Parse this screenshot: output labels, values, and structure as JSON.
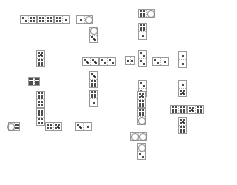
{
  "game": {
    "title": "Dominoes",
    "pip_color": "#111111",
    "border_color": "#9a9a9a",
    "tiles": [
      {
        "x": 20,
        "y": 15,
        "w": 17,
        "h": 9,
        "o": "h",
        "a": 2,
        "b": 4
      },
      {
        "x": 37,
        "y": 15,
        "w": 17,
        "h": 9,
        "o": "h",
        "a": 4,
        "b": 4
      },
      {
        "x": 54,
        "y": 15,
        "w": 16,
        "h": 9,
        "o": "h",
        "a": 4,
        "b": 1
      },
      {
        "x": 76,
        "y": 15,
        "w": 17,
        "h": 9,
        "o": "h",
        "a": 1,
        "b": 0
      },
      {
        "x": 89,
        "y": 27,
        "w": 9,
        "h": 16,
        "o": "v",
        "a": 0,
        "b": 3
      },
      {
        "x": 82,
        "y": 57,
        "w": 17,
        "h": 9,
        "o": "h",
        "a": 3,
        "b": 3
      },
      {
        "x": 99,
        "y": 57,
        "w": 17,
        "h": 9,
        "o": "h",
        "a": 2,
        "b": 2
      },
      {
        "x": 89,
        "y": 71,
        "w": 9,
        "h": 17,
        "o": "v",
        "a": 3,
        "b": 6
      },
      {
        "x": 89,
        "y": 90,
        "w": 9,
        "h": 17,
        "o": "v",
        "a": 6,
        "b": 1
      },
      {
        "x": 36,
        "y": 50,
        "w": 9,
        "h": 17,
        "o": "v",
        "a": 5,
        "b": 6
      },
      {
        "x": 28,
        "y": 77,
        "w": 12,
        "h": 9,
        "o": "h",
        "a": 6,
        "b": 6
      },
      {
        "x": 36,
        "y": 91,
        "w": 9,
        "h": 17,
        "o": "v",
        "a": 6,
        "b": 4
      },
      {
        "x": 36,
        "y": 108,
        "w": 9,
        "h": 18,
        "o": "v",
        "a": 6,
        "b": 4
      },
      {
        "x": 8,
        "y": 122,
        "w": 12,
        "h": 9,
        "o": "h",
        "a": 0,
        "b": 4
      },
      {
        "x": 45,
        "y": 122,
        "w": 17,
        "h": 9,
        "o": "h",
        "a": 4,
        "b": 5
      },
      {
        "x": 75,
        "y": 122,
        "w": 17,
        "h": 9,
        "o": "h",
        "a": 3,
        "b": 1
      },
      {
        "x": 138,
        "y": 9,
        "w": 17,
        "h": 9,
        "o": "h",
        "a": 6,
        "b": 0
      },
      {
        "x": 138,
        "y": 23,
        "w": 9,
        "h": 17,
        "o": "v",
        "a": 6,
        "b": 1
      },
      {
        "x": 125,
        "y": 56,
        "w": 10,
        "h": 9,
        "o": "h",
        "a": 1,
        "b": 1
      },
      {
        "x": 138,
        "y": 50,
        "w": 9,
        "h": 17,
        "o": "v",
        "a": 2,
        "b": 2
      },
      {
        "x": 152,
        "y": 57,
        "w": 17,
        "h": 9,
        "o": "h",
        "a": 2,
        "b": 1
      },
      {
        "x": 138,
        "y": 80,
        "w": 9,
        "h": 17,
        "o": "v",
        "a": 2,
        "b": 2
      },
      {
        "x": 178,
        "y": 51,
        "w": 9,
        "h": 17,
        "o": "v",
        "a": 1,
        "b": 1
      },
      {
        "x": 178,
        "y": 80,
        "w": 9,
        "h": 17,
        "o": "v",
        "a": 1,
        "b": 5
      },
      {
        "x": 170,
        "y": 105,
        "w": 17,
        "h": 9,
        "o": "h",
        "a": 6,
        "b": 6
      },
      {
        "x": 187,
        "y": 105,
        "w": 17,
        "h": 9,
        "o": "h",
        "a": 5,
        "b": 6
      },
      {
        "x": 178,
        "y": 117,
        "w": 9,
        "h": 17,
        "o": "v",
        "a": 5,
        "b": 6
      },
      {
        "x": 137,
        "y": 91,
        "w": 9,
        "h": 17,
        "o": "v",
        "a": 5,
        "b": 6
      },
      {
        "x": 137,
        "y": 108,
        "w": 9,
        "h": 17,
        "o": "v",
        "a": 6,
        "b": 0
      },
      {
        "x": 130,
        "y": 132,
        "w": 17,
        "h": 9,
        "o": "h",
        "a": 0,
        "b": 0
      },
      {
        "x": 137,
        "y": 143,
        "w": 9,
        "h": 17,
        "o": "v",
        "a": 0,
        "b": 2
      }
    ]
  }
}
